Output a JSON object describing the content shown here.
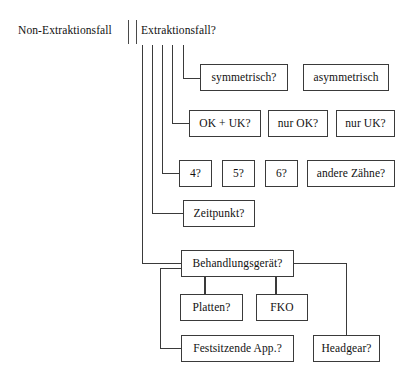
{
  "diagram": {
    "title_left": "Non-Extraktionsfall",
    "title_right": "Extraktionsfall?",
    "nodes": {
      "symmetrisch": "symmetrisch?",
      "asymmetrisch": "asymmetrisch",
      "ok_uk": "OK + UK?",
      "nur_ok": "nur OK?",
      "nur_uk": "nur UK?",
      "vier": "4?",
      "fuenf": "5?",
      "sechs": "6?",
      "andere_zaehne": "andere Zähne?",
      "zeitpunkt": "Zeitpunkt?",
      "behandlungsgeraet": "Behandlungsgerät?",
      "platten": "Platten?",
      "fko": "FKO",
      "festsitzende_app": "Festsitzende App.?",
      "headgear": "Headgear?"
    },
    "colors": {
      "line": "#3a3a3a",
      "text": "#111111",
      "background": "#ffffff"
    }
  }
}
